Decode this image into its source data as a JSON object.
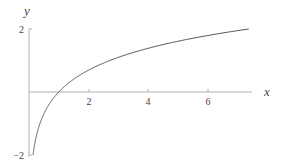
{
  "chart_data": {
    "type": "line",
    "title": "",
    "xlabel": "x",
    "ylabel": "y",
    "function": "y = ln(x)",
    "xlim": [
      0,
      7.5
    ],
    "ylim": [
      -2,
      2
    ],
    "x_ticks": [
      2,
      4,
      6
    ],
    "x_tick_labels": [
      "2",
      "4",
      "6"
    ],
    "y_ticks": [
      -2,
      2
    ],
    "y_tick_labels": [
      "−2",
      "2"
    ],
    "grid": false,
    "legend": null,
    "series": [
      {
        "name": "ln(x)",
        "color": "#555555",
        "x": [
          0.135,
          0.2,
          0.3,
          0.5,
          0.75,
          1,
          1.5,
          2,
          3,
          4,
          5,
          6,
          7,
          7.4
        ],
        "y": [
          -2.0,
          -1.61,
          -1.2,
          -0.69,
          -0.29,
          0,
          0.41,
          0.69,
          1.1,
          1.39,
          1.61,
          1.79,
          1.95,
          2.0
        ]
      }
    ]
  },
  "colors": {
    "axis": "#aaaaaa",
    "curve": "#555555",
    "text": "#444444"
  }
}
